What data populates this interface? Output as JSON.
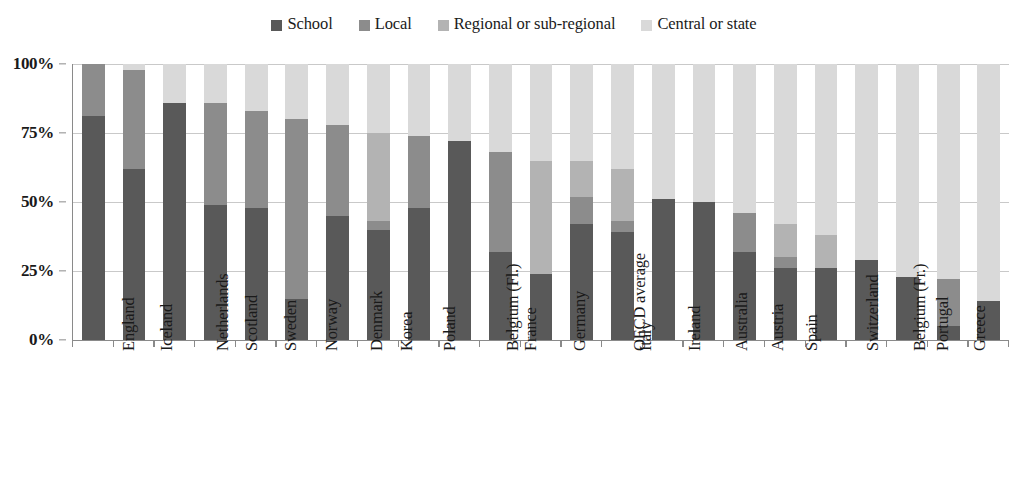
{
  "legend": {
    "items": [
      {
        "label": "School",
        "color": "#595959"
      },
      {
        "label": "Local",
        "color": "#8c8c8c"
      },
      {
        "label": "Regional or sub-regional",
        "color": "#b3b3b3"
      },
      {
        "label": "Central or state",
        "color": "#d9d9d9"
      }
    ]
  },
  "axis": {
    "y_ticks": [
      "100%",
      "75%",
      "50%",
      "25%",
      "0%"
    ],
    "y_values": [
      100,
      75,
      50,
      25,
      0
    ]
  },
  "chart_data": {
    "type": "bar",
    "subtype": "stacked-100-percent",
    "title": "",
    "xlabel": "",
    "ylabel": "",
    "ylim": [
      0,
      100
    ],
    "grid": true,
    "legend_position": "top-center",
    "categories": [
      "England",
      "Iceland",
      "Netherlands",
      "Scotland",
      "Sweden",
      "Norway",
      "Denmark",
      "Korea",
      "Poland",
      "Belgium (Fl.)",
      "France",
      "Germany",
      "OECD average",
      "Italy",
      "Ireland",
      "Australia",
      "Austria",
      "Spain",
      "Switzerland",
      "Belgium (Fr.)",
      "Portugal",
      "Greece",
      "Luxembourg"
    ],
    "series": [
      {
        "name": "School",
        "color": "#595959",
        "values": [
          81,
          62,
          86,
          49,
          48,
          15,
          45,
          40,
          48,
          72,
          32,
          24,
          42,
          39,
          51,
          50,
          32,
          26,
          26,
          29,
          23,
          5,
          14
        ]
      },
      {
        "name": "Local",
        "color": "#8c8c8c",
        "values": [
          19,
          36,
          0,
          37,
          35,
          65,
          33,
          3,
          26,
          0,
          36,
          0,
          10,
          4,
          0,
          0,
          14,
          4,
          0,
          0,
          0,
          17,
          0
        ]
      },
      {
        "name": "Regional or sub-regional",
        "color": "#b3b3b3",
        "values": [
          0,
          0,
          0,
          0,
          0,
          0,
          0,
          32,
          0,
          0,
          0,
          41,
          13,
          19,
          0,
          0,
          0,
          12,
          12,
          0,
          0,
          0,
          0
        ]
      },
      {
        "name": "Central or state",
        "color": "#d9d9d9",
        "values": [
          0,
          2,
          14,
          14,
          17,
          20,
          22,
          25,
          26,
          28,
          32,
          35,
          35,
          38,
          49,
          50,
          54,
          58,
          62,
          71,
          77,
          78,
          86
        ]
      }
    ]
  }
}
